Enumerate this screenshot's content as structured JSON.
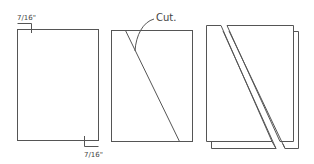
{
  "diagram": {
    "stroke_color": "#555555",
    "panels": [
      {
        "id": "measure",
        "labels": {
          "top_left_offset": "7/16\"",
          "bottom_right_offset": "7/16\""
        }
      },
      {
        "id": "cut",
        "labels": {
          "cut": "Cut."
        }
      },
      {
        "id": "separated",
        "labels": {}
      }
    ]
  }
}
